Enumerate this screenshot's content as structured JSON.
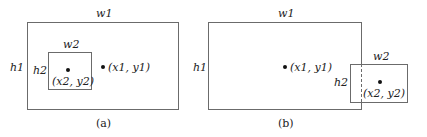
{
  "diagram_a": {
    "outer_width_label": "w1",
    "outer_height_label": "h1",
    "inner_width_label": "w2",
    "inner_height_label": "h2",
    "point1_label": "(x1, y1)",
    "point2_label": "(x2, y2)",
    "caption": "(a)"
  },
  "diagram_b": {
    "outer_width_label": "w1",
    "outer_height_label": "h1",
    "inner_width_label": "w2",
    "inner_height_label": "h2",
    "point1_label": "(x1, y1)",
    "point2_label": "(x2, y2)",
    "caption": "(b)"
  },
  "colors": {
    "line": "#6b6b6b",
    "dot": "#111111"
  }
}
